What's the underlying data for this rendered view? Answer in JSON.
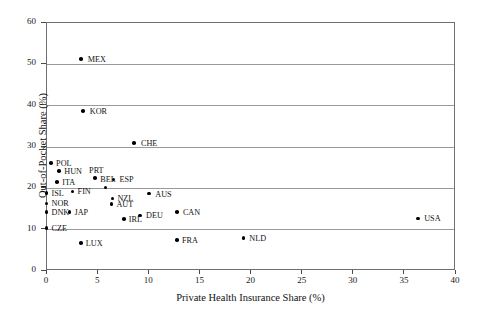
{
  "chart_data": {
    "type": "scatter",
    "title": "",
    "xlabel": "Private Health Insurance Share (%)",
    "ylabel": "Out-of-Pocket Share (%)",
    "xlim": [
      0,
      40
    ],
    "ylim": [
      0,
      60
    ],
    "xticks": [
      0,
      5,
      10,
      15,
      20,
      25,
      30,
      35,
      40
    ],
    "xtick_labels": [
      "0",
      "5",
      "10",
      "15",
      "20",
      "25",
      "30",
      "35",
      "40"
    ],
    "yticks": [
      0,
      10,
      20,
      30,
      40,
      50,
      60
    ],
    "ytick_labels": [
      "0",
      "10",
      "20",
      "30",
      "40",
      "50",
      "60"
    ],
    "grid": "horizontal",
    "legend": "none",
    "marker_color": "#000000",
    "grid_color": "#9a9a9a",
    "frame_color": "#6f6f6f",
    "points": [
      {
        "label": "MEX",
        "x": 3.4,
        "y": 51.0,
        "lx": 7,
        "ly": -3
      },
      {
        "label": "KOR",
        "x": 3.6,
        "y": 38.5,
        "lx": 7,
        "ly": -3
      },
      {
        "label": "CHE",
        "x": 8.6,
        "y": 30.7,
        "lx": 7,
        "ly": -3
      },
      {
        "label": "POL",
        "x": 0.5,
        "y": 25.9,
        "lx": 5,
        "ly": -3
      },
      {
        "label": "HUN",
        "x": 1.3,
        "y": 24.0,
        "lx": 5,
        "ly": -3
      },
      {
        "label": "PRT",
        "x": 4.8,
        "y": 22.2,
        "lx": -6,
        "ly": -11
      },
      {
        "label": "ESP",
        "x": 6.6,
        "y": 21.9,
        "lx": 6,
        "ly": -3
      },
      {
        "label": "ITA",
        "x": 1.1,
        "y": 21.3,
        "lx": 5,
        "ly": -3
      },
      {
        "label": "BEL",
        "x": 5.8,
        "y": 20.0,
        "lx": -5,
        "ly": -11
      },
      {
        "label": "FIN",
        "x": 2.6,
        "y": 19.0,
        "lx": 5,
        "ly": -3
      },
      {
        "label": "ISL",
        "x": 0.05,
        "y": 18.7,
        "lx": 5,
        "ly": -3
      },
      {
        "label": "AUS",
        "x": 10.1,
        "y": 18.5,
        "lx": 6,
        "ly": -3
      },
      {
        "label": "NZL",
        "x": 6.5,
        "y": 17.3,
        "lx": 5,
        "ly": -3
      },
      {
        "label": "NOR",
        "x": 0.05,
        "y": 16.1,
        "lx": 5,
        "ly": -3
      },
      {
        "label": "AUT",
        "x": 6.4,
        "y": 16.0,
        "lx": 5,
        "ly": -3
      },
      {
        "label": "DNK",
        "x": 0.05,
        "y": 14.1,
        "lx": 5,
        "ly": -3
      },
      {
        "label": "JAP",
        "x": 2.3,
        "y": 14.1,
        "lx": 5,
        "ly": -3
      },
      {
        "label": "CAN",
        "x": 12.8,
        "y": 14.0,
        "lx": 6,
        "ly": -3
      },
      {
        "label": "DEU",
        "x": 9.2,
        "y": 13.2,
        "lx": 6,
        "ly": -3
      },
      {
        "label": "USA",
        "x": 36.4,
        "y": 12.5,
        "lx": 6,
        "ly": -3
      },
      {
        "label": "IRL",
        "x": 7.6,
        "y": 12.3,
        "lx": 5,
        "ly": -3
      },
      {
        "label": "CZE",
        "x": 0.05,
        "y": 10.2,
        "lx": 5,
        "ly": -3
      },
      {
        "label": "NLD",
        "x": 19.3,
        "y": 7.7,
        "lx": 6,
        "ly": -3
      },
      {
        "label": "FRA",
        "x": 12.8,
        "y": 7.2,
        "lx": 5,
        "ly": -3
      },
      {
        "label": "LUX",
        "x": 3.4,
        "y": 6.5,
        "lx": 5,
        "ly": -3
      }
    ]
  }
}
